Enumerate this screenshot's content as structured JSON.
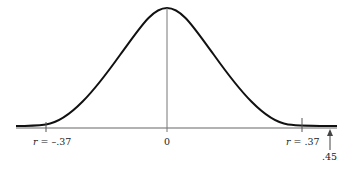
{
  "diagram": {
    "type": "normal-distribution-curve",
    "center_label": "0",
    "left_label": {
      "var": "r",
      "eq": " = ",
      "value": "–.37"
    },
    "right_label": {
      "var": "r",
      "eq": " = ",
      "value": ".37"
    },
    "arrow_label": ".45",
    "colors": {
      "curve": "#111111",
      "axis": "#555555",
      "text": "#222222"
    }
  }
}
